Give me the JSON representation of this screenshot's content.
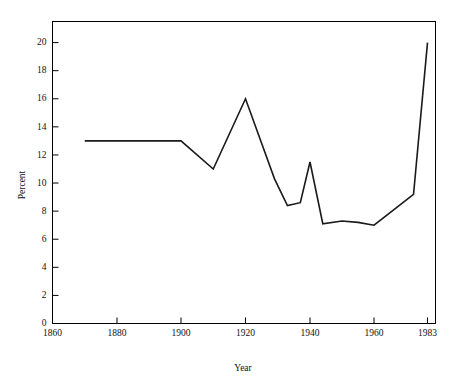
{
  "chart_data": {
    "type": "line",
    "title": "",
    "xlabel": "Year",
    "ylabel": "Percent",
    "xlim": [
      1860,
      1983
    ],
    "ylim": [
      0,
      21.5
    ],
    "grid": false,
    "legend": null,
    "x_ticks": [
      1860,
      1880,
      1900,
      1920,
      1940,
      1960,
      1983
    ],
    "x_tick_labels": [
      "1860",
      "1880",
      "1900",
      "1920",
      "1940",
      "1960",
      "1983"
    ],
    "y_ticks": [
      0,
      2,
      4,
      6,
      8,
      10,
      12,
      14,
      16,
      18,
      20
    ],
    "y_tick_labels": [
      "0",
      "2",
      "4",
      "6",
      "8",
      "10",
      "12",
      "14",
      "16",
      "18",
      "20"
    ],
    "series": [
      {
        "name": "Percent",
        "color": "#1a1a1a",
        "x": [
          1870,
          1900,
          1910,
          1920,
          1929,
          1933,
          1937,
          1940,
          1944,
          1950,
          1955,
          1960,
          1977,
          1983
        ],
        "y": [
          13.0,
          13.0,
          11.0,
          16.0,
          10.3,
          8.4,
          8.6,
          11.5,
          7.1,
          7.3,
          7.2,
          7.0,
          9.2,
          20.0
        ]
      }
    ]
  },
  "axis": {
    "y_label": "Percent",
    "x_label": "Year"
  }
}
